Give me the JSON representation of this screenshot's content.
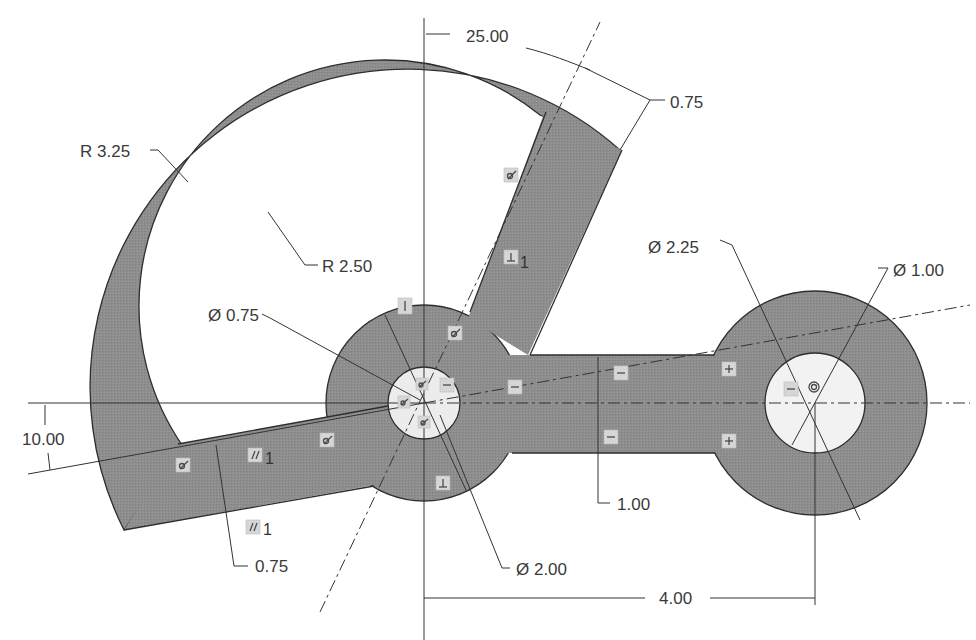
{
  "drawing": {
    "type": "2D parametric sketch with dimensions and constraints",
    "colors": {
      "background": "#ffffff",
      "part_fill": "#8c8c8c",
      "outline": "#2e2e2e",
      "dimension_line": "#333333",
      "centerline": "#333333",
      "hole_fill": "#ececec",
      "constraint_badge": "#d6d6d6"
    },
    "dimensions": {
      "angle_top": "25.00",
      "arm_width_top": "0.75",
      "outer_radius": "R 3.25",
      "inner_radius": "R 2.50",
      "hub_hole_diameter": "Ø 0.75",
      "boss_outer_diameter": "Ø 2.25",
      "boss_hole_diameter": "Ø 1.00",
      "angle_left": "10.00",
      "arm_width_left": "0.75",
      "arm_width_horizontal": "1.00",
      "hub_diameter": "Ø 2.00",
      "center_distance": "4.00"
    },
    "constraints": [
      {
        "type": "tangent",
        "icon": "tangent-icon",
        "label": ""
      },
      {
        "type": "perpendicular",
        "icon": "perpendicular-icon",
        "label": "1"
      },
      {
        "type": "parallel",
        "icon": "parallel-icon",
        "label": "1"
      },
      {
        "type": "parallel",
        "icon": "parallel-icon",
        "label": "1"
      },
      {
        "type": "vertical",
        "icon": "vertical-icon",
        "label": ""
      },
      {
        "type": "horizontal",
        "icon": "horizontal-icon",
        "label": ""
      },
      {
        "type": "symmetric",
        "icon": "symmetric-icon",
        "label": ""
      },
      {
        "type": "perpendicular",
        "icon": "perpendicular-icon",
        "label": ""
      },
      {
        "type": "concentric",
        "icon": "concentric-icon",
        "label": ""
      }
    ],
    "constraint_labels": {
      "perp_index": "1",
      "parallel_index_a": "1",
      "parallel_index_b": "1"
    }
  }
}
